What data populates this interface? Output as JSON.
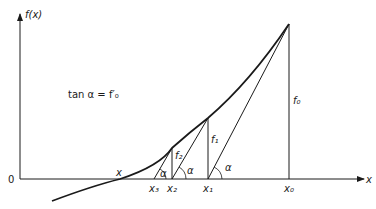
{
  "figure": {
    "type": "newton-method-diagram",
    "y_axis_label": "f(x)",
    "x_axis_label": "x",
    "origin_label": "0",
    "formula": "tan α = f′₀",
    "root_label": "x",
    "angle_label": "α",
    "points": [
      {
        "x_label": "x₀",
        "f_label": "f₀"
      },
      {
        "x_label": "x₁",
        "f_label": "f₁"
      },
      {
        "x_label": "x₂",
        "f_label": "f₂"
      },
      {
        "x_label": "x₃",
        "f_label": ""
      }
    ],
    "colors": {
      "line": "#1a1a1a",
      "background": "#ffffff"
    }
  }
}
